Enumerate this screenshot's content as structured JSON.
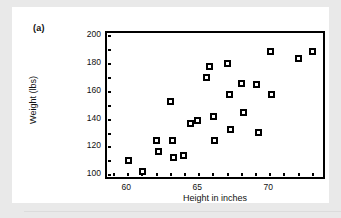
{
  "figure": {
    "panel_label": "(a)",
    "x_axis_title": "Height in inches",
    "y_axis_title": "Weight (lbs)"
  },
  "chart_data": {
    "type": "scatter",
    "title": "",
    "xlabel": "Height in inches",
    "ylabel": "Weight (lbs)",
    "xlim": [
      58.5,
      74.0
    ],
    "ylim": [
      96,
      202
    ],
    "xticks": [
      60,
      65,
      70
    ],
    "yticks": [
      100,
      120,
      140,
      160,
      180,
      200
    ],
    "xtick_labels": [
      "60",
      "65",
      "70"
    ],
    "ytick_labels": [
      "100",
      "120",
      "140",
      "160",
      "180",
      "200"
    ],
    "grid": false,
    "legend": null,
    "marker": "square-open-filled",
    "marker_color": "#000000",
    "points": [
      {
        "x": 60.0,
        "y": 111
      },
      {
        "x": 61.0,
        "y": 103
      },
      {
        "x": 62.0,
        "y": 125
      },
      {
        "x": 62.1,
        "y": 117
      },
      {
        "x": 63.0,
        "y": 153
      },
      {
        "x": 63.1,
        "y": 125
      },
      {
        "x": 63.2,
        "y": 113
      },
      {
        "x": 63.9,
        "y": 114
      },
      {
        "x": 64.4,
        "y": 137
      },
      {
        "x": 64.9,
        "y": 139
      },
      {
        "x": 65.5,
        "y": 170
      },
      {
        "x": 65.7,
        "y": 178
      },
      {
        "x": 66.0,
        "y": 142
      },
      {
        "x": 66.1,
        "y": 125
      },
      {
        "x": 67.0,
        "y": 180
      },
      {
        "x": 67.1,
        "y": 158
      },
      {
        "x": 67.2,
        "y": 133
      },
      {
        "x": 68.0,
        "y": 166
      },
      {
        "x": 68.1,
        "y": 145
      },
      {
        "x": 69.0,
        "y": 165
      },
      {
        "x": 69.2,
        "y": 131
      },
      {
        "x": 70.0,
        "y": 189
      },
      {
        "x": 70.1,
        "y": 158
      },
      {
        "x": 72.0,
        "y": 184
      },
      {
        "x": 73.0,
        "y": 189
      }
    ]
  }
}
